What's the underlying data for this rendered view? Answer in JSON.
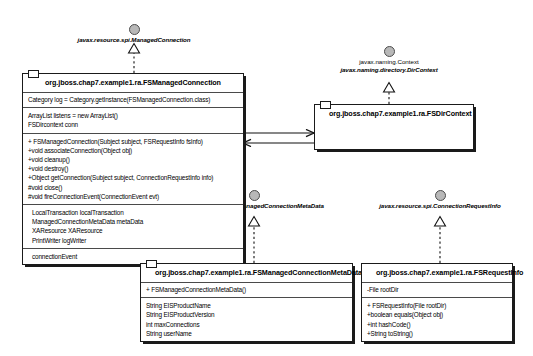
{
  "diagram": {
    "type": "uml-class-diagram",
    "background": "#ffffff",
    "line_color": "#1a1a1a",
    "interface_ball_color": "#b8b8b8"
  },
  "interfaces": [
    {
      "id": "managed-connection",
      "name": "javax.resource.spi.ManagedConnection",
      "realized_by": "fsmanagedconnection"
    },
    {
      "id": "naming-context",
      "name": "javax.naming.Context",
      "secondary_name": "javax.naming.directory.DirContext",
      "realized_by": "fsdircontext"
    },
    {
      "id": "managed-connection-metadata",
      "name": "javax.resource.spi.ManagedConnectionMetaData",
      "realized_by": "fsmanagedconnectionmetadata"
    },
    {
      "id": "connection-request-info",
      "name": "javax.resource.spi.ConnectionRequestInfo",
      "realized_by": "fsrequestinfo"
    }
  ],
  "classes": [
    {
      "id": "fsmanagedconnection",
      "name": "org.jboss.chap7.example1.ra.FSManagedConnection",
      "compartments": [
        {
          "id": "static-fields",
          "members": [
            "Category log = Category.getInstance(FSManagedConnection.class)"
          ]
        },
        {
          "id": "fields",
          "members": [
            "ArrayList listens = new ArrayList()",
            "FSDircontext conn"
          ]
        },
        {
          "id": "operations",
          "members": [
            "+ FSManagedConnection(Subject subject, FSRequestInfo fsInfo)",
            "+void associateConnection(Object obj)",
            "+void cleanup()",
            "+void destroy()",
            "+Object getConnection(Subject subject, ConnectionRequestInfo info)",
            "#void close()",
            "#void fireConnectionEvent(ConnectionEvent evt)"
          ]
        },
        {
          "id": "associations",
          "members": [
            "LocalTransaction localTransaction",
            "ManagedConnectionMetaData metaData",
            "XAResource XAResource",
            "PrintWriter logWriter"
          ]
        },
        {
          "id": "events",
          "members": [
            "connectionEvent"
          ]
        }
      ]
    },
    {
      "id": "fsdircontext",
      "name": "org.jboss.chap7.example1.ra.FSDirContext",
      "compartments": []
    },
    {
      "id": "fsmanagedconnectionmetadata",
      "name": "org.jboss.chap7.example1.ra.FSManagedConnectionMetaData",
      "compartments": [
        {
          "id": "operations",
          "members": [
            "+ FSManagedConnectionMetaData()"
          ]
        },
        {
          "id": "fields",
          "members": [
            "String EISProductName",
            "String EISProductVersion",
            "int maxConnections",
            "String userName"
          ]
        }
      ]
    },
    {
      "id": "fsrequestinfo",
      "name": "org.jboss.chap7.example1.ra.FSRequestInfo",
      "compartments": [
        {
          "id": "fields",
          "members": [
            "-File rootDir"
          ]
        },
        {
          "id": "operations",
          "members": [
            "+ FSRequestInfo(File rootDir)",
            "+boolean equals(Object obj)",
            "+int hashCode()",
            "+String toString()"
          ]
        }
      ]
    }
  ],
  "connectors": [
    {
      "id": "realize-managed-connection",
      "kind": "realization",
      "from": "fsmanagedconnection",
      "to": "managed-connection"
    },
    {
      "id": "realize-dir-context",
      "kind": "realization",
      "from": "fsdircontext",
      "to": "naming-context"
    },
    {
      "id": "realize-metadata",
      "kind": "realization",
      "from": "fsmanagedconnectionmetadata",
      "to": "managed-connection-metadata"
    },
    {
      "id": "realize-request-info",
      "kind": "realization",
      "from": "fsrequestinfo",
      "to": "connection-request-info"
    },
    {
      "id": "assoc-mc-to-dc",
      "kind": "association",
      "from": "fsmanagedconnection",
      "to": "fsdircontext"
    },
    {
      "id": "assoc-dc-to-mc",
      "kind": "association",
      "from": "fsdircontext",
      "to": "fsmanagedconnection"
    }
  ]
}
